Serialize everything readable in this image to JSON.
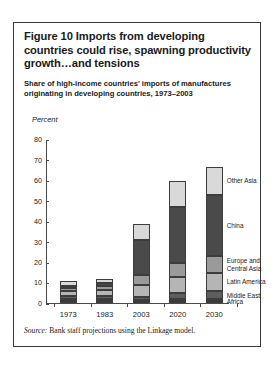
{
  "figure": {
    "title": "Figure 10  Imports from developing countries could rise, spawning productivity growth…and tensions",
    "subtitle": "Share of high-income countries' imports of manufactures originating in developing countries, 1973–2003",
    "source_prefix": "Source:",
    "source_text": " Bank staff projections using the Linkage model."
  },
  "chart_data": {
    "type": "bar",
    "stacked": true,
    "title": "Share of high-income countries' imports of manufactures originating in developing countries, 1973–2003",
    "xlabel": "",
    "ylabel": "Percent",
    "ylim": [
      0,
      80
    ],
    "yticks": [
      0,
      10,
      20,
      30,
      40,
      50,
      60,
      70,
      80
    ],
    "grid": false,
    "legend_position": "right-inline",
    "categories": [
      "1973",
      "1983",
      "2003",
      "2020",
      "2030"
    ],
    "series": [
      {
        "name": "Africa",
        "color": "#3a3a3a",
        "values": [
          2.0,
          2.0,
          1.5,
          2.0,
          2.0
        ]
      },
      {
        "name": "Middle East",
        "color": "#5e5e5e",
        "values": [
          1.5,
          1.5,
          1.5,
          3.0,
          4.0
        ]
      },
      {
        "name": "Latin America",
        "color": "#b5b5b5",
        "values": [
          2.5,
          3.0,
          6.0,
          8.0,
          9.0
        ]
      },
      {
        "name": "Europe and Central Asia",
        "color": "#9a9a9a",
        "values": [
          1.5,
          2.0,
          5.0,
          7.0,
          8.0
        ]
      },
      {
        "name": "China",
        "color": "#4a4a4a",
        "values": [
          1.0,
          1.5,
          17.0,
          27.0,
          30.0
        ]
      },
      {
        "name": "Other Asia",
        "color": "#d9d9d9",
        "values": [
          2.5,
          2.0,
          8.0,
          13.0,
          14.0
        ]
      }
    ],
    "totals": [
      11.0,
      12.0,
      39.0,
      60.0,
      67.0
    ]
  },
  "legend": {
    "items": [
      {
        "label": "Other Asia"
      },
      {
        "label": "China"
      },
      {
        "label": "Europe and"
      },
      {
        "label": "Central Asia"
      },
      {
        "label": "Latin America"
      },
      {
        "label": "Middle East"
      },
      {
        "label": "Africa"
      }
    ]
  }
}
